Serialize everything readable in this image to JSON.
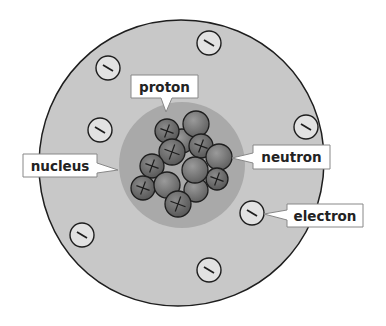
{
  "diagram": {
    "type": "atom-structure",
    "colors": {
      "background": "#ffffff",
      "electron_cloud": "#c8c8c8",
      "nucleus_region": "#a8a8a8",
      "proton": "#6e6e6e",
      "neutron": "#7a7a7a",
      "electron": "#e2e2e2",
      "outline": "#1e1e1e",
      "label_box": "#ffffff"
    },
    "labels": {
      "proton": "proton",
      "nucleus": "nucleus",
      "neutron": "neutron",
      "electron": "electron"
    },
    "symbols": {
      "proton": "+",
      "electron": "−"
    },
    "electron_count": 9,
    "nucleus_particles": {
      "protons": 8,
      "neutrons": 6
    }
  }
}
